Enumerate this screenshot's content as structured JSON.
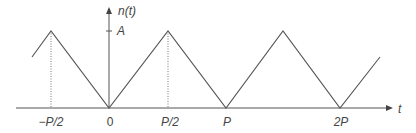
{
  "diagram": {
    "y_axis_label": "n(t)",
    "x_axis_label": "t",
    "amplitude_label": "A",
    "x_ticks": [
      {
        "label": "−P/2",
        "x": 51
      },
      {
        "label": "0",
        "x": 109
      },
      {
        "label": "P/2",
        "x": 168
      },
      {
        "label": "P",
        "x": 226
      },
      {
        "label": "2P",
        "x": 340
      }
    ],
    "waveform_points": [
      [
        32,
        57
      ],
      [
        51,
        31
      ],
      [
        109,
        108
      ],
      [
        168,
        31
      ],
      [
        226,
        108
      ],
      [
        283,
        31
      ],
      [
        340,
        108
      ],
      [
        380,
        57
      ]
    ],
    "colors": {
      "line": "#555555",
      "text": "#444444"
    }
  }
}
